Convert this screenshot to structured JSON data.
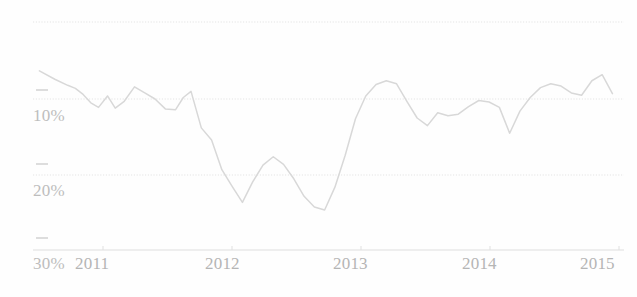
{
  "chart_data": {
    "type": "line",
    "title": "",
    "subtitle": "",
    "xlabel": "",
    "ylabel": "",
    "x_tick_labels": [
      "2011",
      "2012",
      "2013",
      "2014",
      "2015"
    ],
    "x_tick_values": [
      2011,
      2012,
      2013,
      2014,
      2015
    ],
    "y_tick_labels": [
      "10%",
      "20%",
      "30%"
    ],
    "y_tick_values": [
      10,
      20,
      30
    ],
    "ylim": [
      32.5,
      5.5
    ],
    "y_axis_inverted": true,
    "xlim": [
      2010.75,
      2015.35
    ],
    "grid": "horizontal-dotted",
    "legend": "none",
    "line_color": "#d8d8d8",
    "gridline_color": "#e2e2e2",
    "axis_color": "#dcdcdc",
    "background_color": "#ffffff",
    "series": [
      {
        "name": "rate",
        "x": [
          2010.8,
          2010.92,
          2011.02,
          2011.08,
          2011.14,
          2011.2,
          2011.26,
          2011.33,
          2011.39,
          2011.46,
          2011.54,
          2011.62,
          2011.7,
          2011.78,
          2011.86,
          2011.92,
          2011.98,
          2012.06,
          2012.14,
          2012.22,
          2012.3,
          2012.38,
          2012.46,
          2012.54,
          2012.62,
          2012.7,
          2012.78,
          2012.86,
          2012.94,
          2013.02,
          2013.1,
          2013.18,
          2013.26,
          2013.34,
          2013.42,
          2013.5,
          2013.58,
          2013.66,
          2013.74,
          2013.82,
          2013.9,
          2013.98,
          2014.06,
          2014.14,
          2014.22,
          2014.3,
          2014.38,
          2014.46,
          2014.54,
          2014.62,
          2014.7,
          2014.78,
          2014.86,
          2014.94,
          2015.02,
          2015.1,
          2015.18,
          2015.26
        ],
        "y": [
          6.3,
          7.4,
          8.2,
          8.6,
          9.4,
          10.5,
          11.1,
          9.6,
          11.2,
          10.3,
          8.4,
          9.2,
          10.0,
          11.3,
          11.4,
          9.8,
          9.0,
          13.8,
          15.4,
          19.3,
          21.5,
          23.6,
          20.9,
          18.7,
          17.6,
          18.6,
          20.5,
          22.8,
          24.2,
          24.6,
          21.6,
          17.4,
          12.6,
          9.6,
          8.1,
          7.6,
          8.0,
          10.3,
          12.5,
          13.5,
          11.8,
          12.2,
          12.0,
          11.0,
          10.2,
          10.4,
          11.1,
          14.5,
          11.6,
          9.8,
          8.5,
          8.0,
          8.3,
          9.2,
          9.5,
          7.6,
          6.8,
          9.3
        ]
      }
    ]
  },
  "axes": {
    "y_ticks": [
      {
        "label": "10%",
        "value": 10
      },
      {
        "label": "20%",
        "value": 20
      },
      {
        "label": "30%",
        "value": 30
      }
    ],
    "x_ticks": [
      {
        "label": "2011",
        "value": 2011
      },
      {
        "label": "2012",
        "value": 2012
      },
      {
        "label": "2013",
        "value": 2013
      },
      {
        "label": "2014",
        "value": 2014
      },
      {
        "label": "2015",
        "value": 2015
      }
    ]
  }
}
